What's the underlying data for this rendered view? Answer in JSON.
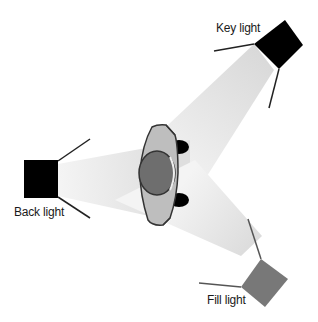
{
  "lights": [
    {
      "id": "key",
      "label": "Key light",
      "color": "#000000"
    },
    {
      "id": "back",
      "label": "Back light",
      "color": "#000000"
    },
    {
      "id": "fill",
      "label": "Fill light",
      "color": "#7a7a7a"
    }
  ],
  "subject": {
    "label": "",
    "head_color": "#6e6e6e",
    "shoulders_color": "#bdbdbd"
  },
  "colors": {
    "beam": "#dcdcdc",
    "background": "#ffffff",
    "outline": "#333333"
  }
}
